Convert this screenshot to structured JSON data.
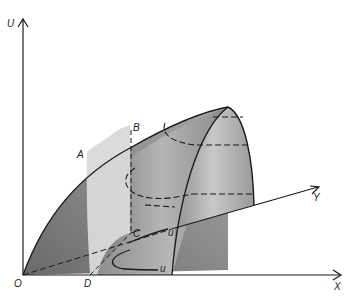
{
  "figure": {
    "axes": {
      "vertical": "U",
      "horizontal": "X",
      "depth": "Y",
      "origin": "O"
    },
    "points": {
      "A": "A",
      "B": "B",
      "C": "C",
      "D": "D"
    },
    "curve_labels": {
      "upper": "u",
      "lower": "u"
    },
    "colors": {
      "surface_dark": "#6e6e6e",
      "surface_mid": "#9a9a9a",
      "surface_light": "#cfcfcf",
      "plane": "#d9d9d9",
      "line": "#1a1a1a"
    }
  }
}
